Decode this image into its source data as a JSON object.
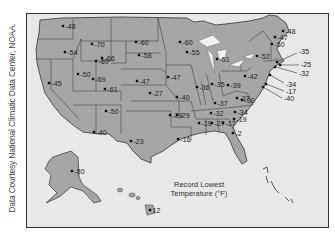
{
  "credit": "Data Courtesy National Climatic Data Center, NOAA.",
  "legend": {
    "line1": "Record Lowest",
    "line2": "Temperature (°F)"
  },
  "colors": {
    "land": "#a6a6a6",
    "water": "#e8e8e8",
    "border": "#333333",
    "lakes": "#f2f2f2"
  },
  "records": [
    {
      "state": "WA",
      "value": "-48",
      "x": 62,
      "y": 25
    },
    {
      "state": "OR",
      "value": "-54",
      "x": 64,
      "y": 51
    },
    {
      "state": "CA",
      "value": "-45",
      "x": 48,
      "y": 82
    },
    {
      "state": "NV",
      "value": "-50",
      "x": 77,
      "y": 73
    },
    {
      "state": "ID",
      "value": "-60",
      "x": 95,
      "y": 60
    },
    {
      "state": "MT",
      "value": "-70",
      "x": 91,
      "y": 43
    },
    {
      "state": "WY",
      "value": "-66",
      "x": 101,
      "y": 57
    },
    {
      "state": "UT",
      "value": "-69",
      "x": 92,
      "y": 78
    },
    {
      "state": "CO",
      "value": "-61",
      "x": 104,
      "y": 88
    },
    {
      "state": "AZ",
      "value": "-40",
      "x": 93,
      "y": 131
    },
    {
      "state": "NM",
      "value": "-50",
      "x": 105,
      "y": 110
    },
    {
      "state": "TX",
      "value": "-23",
      "x": 130,
      "y": 140
    },
    {
      "state": "ND",
      "value": "-60",
      "x": 135,
      "y": 41
    },
    {
      "state": "SD",
      "value": "-58",
      "x": 138,
      "y": 54
    },
    {
      "state": "NE",
      "value": "-47",
      "x": 136,
      "y": 80
    },
    {
      "state": "KS",
      "value": "-27",
      "x": 149,
      "y": 92
    },
    {
      "state": "OK",
      "value": "-29",
      "x": 169,
      "y": 114
    },
    {
      "state": "MN",
      "value": "-60",
      "x": 179,
      "y": 41
    },
    {
      "state": "IA",
      "value": "-47",
      "x": 167,
      "y": 76
    },
    {
      "state": "MO",
      "value": "-40",
      "x": 176,
      "y": 96
    },
    {
      "state": "AR",
      "value": "-29",
      "x": 176,
      "y": 114
    },
    {
      "state": "LA",
      "value": "-16",
      "x": 177,
      "y": 138
    },
    {
      "state": "WI",
      "value": "-55",
      "x": 186,
      "y": 51
    },
    {
      "state": "IL",
      "value": "-36",
      "x": 196,
      "y": 86
    },
    {
      "state": "MI",
      "value": "-51",
      "x": 216,
      "y": 58
    },
    {
      "state": "IN",
      "value": "-35",
      "x": 211,
      "y": 83
    },
    {
      "state": "OH",
      "value": "-39",
      "x": 227,
      "y": 84
    },
    {
      "state": "KY",
      "value": "-37",
      "x": 214,
      "y": 102
    },
    {
      "state": "TN",
      "value": "-32",
      "x": 210,
      "y": 112
    },
    {
      "state": "MS",
      "value": "-19",
      "x": 198,
      "y": 122
    },
    {
      "state": "AL",
      "value": "-27",
      "x": 211,
      "y": 122
    },
    {
      "state": "GA",
      "value": "-17",
      "x": 222,
      "y": 122
    },
    {
      "state": "SC",
      "value": "-19",
      "x": 233,
      "y": 118
    },
    {
      "state": "NC",
      "value": "-34",
      "x": 234,
      "y": 111
    },
    {
      "state": "VA",
      "value": "-30",
      "x": 241,
      "y": 99
    },
    {
      "state": "WV",
      "value": "-37",
      "x": 236,
      "y": 97
    },
    {
      "state": "PA",
      "value": "-42",
      "x": 244,
      "y": 75
    },
    {
      "state": "NY",
      "value": "-52",
      "x": 256,
      "y": 55
    },
    {
      "state": "VT",
      "value": "-50",
      "x": 271,
      "y": 43
    },
    {
      "state": "NH",
      "value": "-47",
      "x": 274,
      "y": 36
    },
    {
      "state": "ME",
      "value": "-48",
      "x": 282,
      "y": 30
    },
    {
      "state": "MA",
      "value": "-35",
      "x": 276,
      "y": 61
    },
    {
      "state": "RI",
      "value": "-25",
      "x": 279,
      "y": 64
    },
    {
      "state": "CT",
      "value": "-32",
      "x": 274,
      "y": 66
    },
    {
      "state": "NJ",
      "value": "-34",
      "x": 269,
      "y": 74
    },
    {
      "state": "DE",
      "value": "-17",
      "x": 265,
      "y": 83
    },
    {
      "state": "MD",
      "value": "-40",
      "x": 262,
      "y": 86
    },
    {
      "state": "FL",
      "value": "-2",
      "x": 232,
      "y": 132
    },
    {
      "state": "AK",
      "value": "-80",
      "x": 71,
      "y": 170
    },
    {
      "state": "HI",
      "value": "12",
      "x": 149,
      "y": 209
    }
  ]
}
